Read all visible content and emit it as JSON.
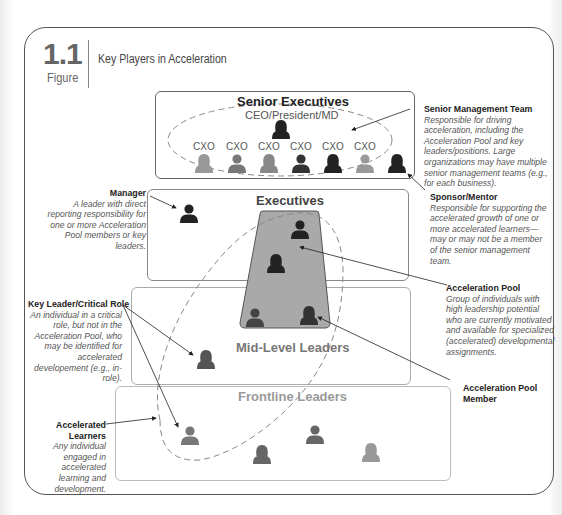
{
  "figure": {
    "number": "1.1",
    "label": "Figure",
    "title": "Key Players in Acceleration"
  },
  "tiers": {
    "senior": {
      "title": "Senior Executives",
      "subtitle": "CEO/President/MD",
      "cxo_labels": [
        "CXO",
        "CXO",
        "CXO",
        "CXO",
        "CXO",
        "CXO"
      ]
    },
    "executives": {
      "title": "Executives"
    },
    "mid_level": {
      "title": "Mid-Level Leaders"
    },
    "frontline": {
      "title": "Frontline Leaders"
    }
  },
  "annotations": {
    "senior_management_team": {
      "title": "Senior Management Team",
      "description": "Responsible for driving acceleration, including the Acceleration Pool and key leaders/positions. Large organizations may have multiple senior management teams (e.g., for each business)."
    },
    "sponsor_mentor": {
      "title": "Sponsor/Mentor",
      "description": "Responsible for supporting the accelerated growth of one or more accelerated learners—may or may not be a member of the senior management team."
    },
    "acceleration_pool": {
      "title": "Acceleration Pool",
      "description": "Group of individuals with high leadership potential who are currently motivated and available for specialized (accelerated) developmental assignments."
    },
    "acceleration_pool_member": {
      "title": "Acceleration Pool Member"
    },
    "manager": {
      "title": "Manager",
      "description": "A leader with direct reporting responsibility for one or more Acceleration Pool members or key leaders."
    },
    "key_leader": {
      "title": "Key Leader/Critical Role",
      "description": "An individual in a critical role, but not in the Acceleration Pool, who may be identified for accelerated developement (e.g., in-role)."
    },
    "accelerated_learners": {
      "title": "Accelerated Learners",
      "description": "Any individual engaged in accelerated learning and development."
    }
  },
  "colors": {
    "frame": "#555555",
    "pool_fill": "#a9a9a9",
    "dashed": "#888888",
    "person_dark": "#222222",
    "person_mid": "#666666",
    "person_light": "#999999"
  }
}
